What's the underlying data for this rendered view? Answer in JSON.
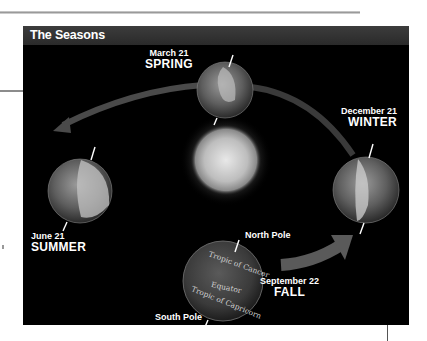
{
  "figure": {
    "title": "The Seasons"
  },
  "seasons": [
    {
      "date": "March 21",
      "season": "SPRING"
    },
    {
      "date": "December 21",
      "season": "WINTER"
    },
    {
      "date": "June 21",
      "season": "SUMMER"
    },
    {
      "date": "September 22",
      "season": "FALL"
    }
  ],
  "fall_globe": {
    "north_pole": "North Pole",
    "south_pole": "South Pole",
    "tropic_cancer": "Tropic of Cancer",
    "equator": "Equator",
    "tropic_capricorn": "Tropic of Capricorn"
  },
  "colors": {
    "background": "#000000",
    "header": "#333333",
    "text": "#ffffff"
  }
}
